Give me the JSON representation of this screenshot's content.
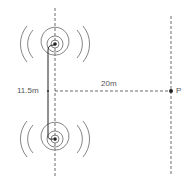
{
  "diagram": {
    "title": "",
    "labels": {
      "separation": "11.5m",
      "distance": "20m",
      "point": "P"
    },
    "sources": [
      {
        "name": "upper-source",
        "cx": 55,
        "cy": 44,
        "rings": [
          7,
          13,
          19,
          25
        ]
      },
      {
        "name": "lower-source",
        "cx": 55,
        "cy": 139,
        "rings": [
          7,
          13,
          19,
          25
        ]
      }
    ],
    "colors": {
      "line": "#333333",
      "ring": "#777777",
      "text": "#555555"
    }
  }
}
